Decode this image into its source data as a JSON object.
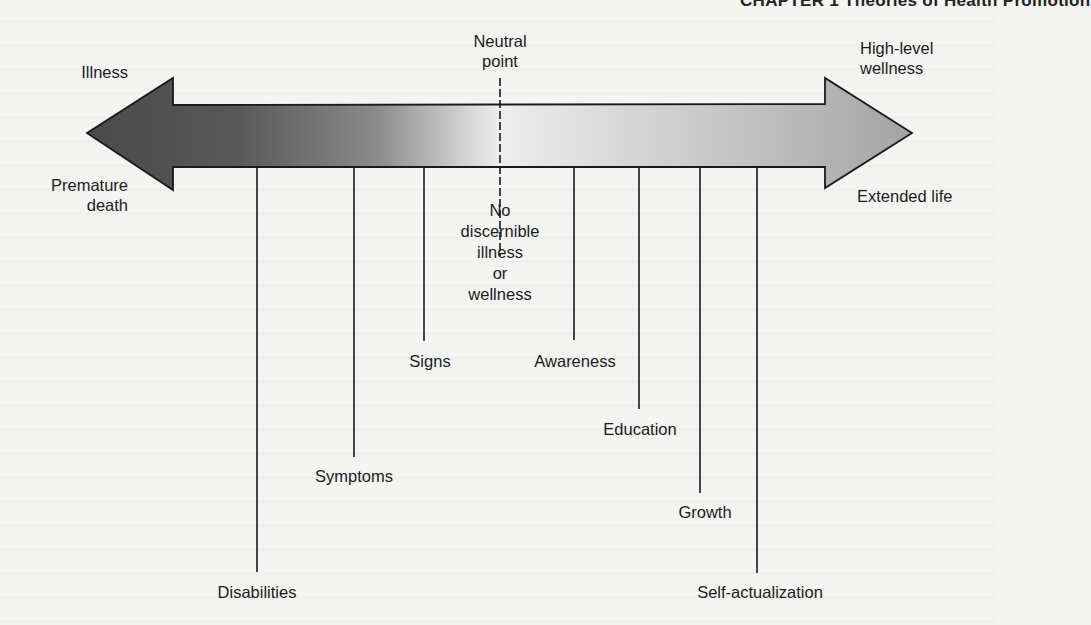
{
  "header": {
    "chapter_running_head": "CHAPTER 1  Theories of Health Promotion"
  },
  "diagram": {
    "left_end": {
      "top_label": "Illness",
      "bottom_label_line1": "Premature",
      "bottom_label_line2": "death"
    },
    "right_end": {
      "top_label_line1": "High-level",
      "top_label_line2": "wellness",
      "bottom_label": "Extended life"
    },
    "neutral_point": {
      "label_line1": "Neutral",
      "label_line2": "point",
      "description_lines": [
        "No",
        "discernible",
        "illness",
        "or",
        "wellness"
      ]
    },
    "illness_side_markers": [
      {
        "label": "Disabilities",
        "x": 257,
        "line_end_y": 572
      },
      {
        "label": "Symptoms",
        "x": 354,
        "line_end_y": 457
      },
      {
        "label": "Signs",
        "x": 424,
        "line_end_y": 341
      }
    ],
    "wellness_side_markers": [
      {
        "label": "Awareness",
        "x": 574,
        "line_end_y": 340
      },
      {
        "label": "Education",
        "x": 639,
        "line_end_y": 409
      },
      {
        "label": "Growth",
        "x": 700,
        "line_end_y": 493
      },
      {
        "label": "Self-actualization",
        "x": 757,
        "line_end_y": 573
      }
    ],
    "colors": {
      "arrow_dark": "#4a4a4a",
      "arrow_light": "#f2f2f2",
      "arrow_right": "#a8a8a8",
      "stroke": "#1a1a1a"
    }
  }
}
